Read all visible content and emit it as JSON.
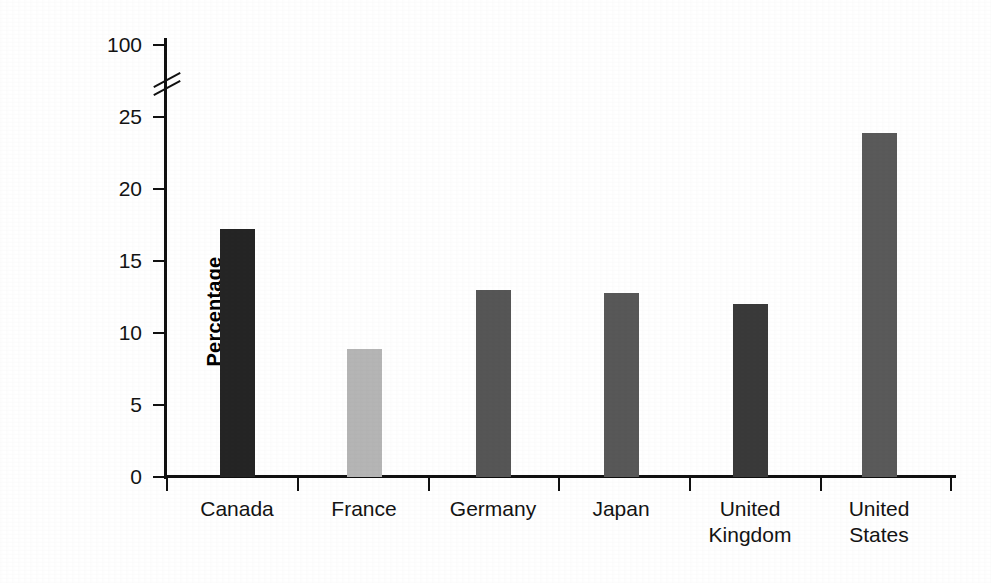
{
  "chart_data": {
    "type": "bar",
    "title": "",
    "xlabel": "",
    "ylabel": "Percentage",
    "categories": [
      "Canada",
      "France",
      "Germany",
      "Japan",
      "United Kingdom",
      "United States"
    ],
    "values": [
      17.2,
      8.9,
      13.0,
      12.8,
      12.0,
      23.9
    ],
    "series": [
      {
        "name": "Percentage",
        "values": [
          17.2,
          8.9,
          13.0,
          12.8,
          12.0,
          23.9
        ]
      }
    ],
    "bar_colors": [
      "#252525",
      "#b5b5b5",
      "#565656",
      "#585858",
      "#3a3a3a",
      "#5a5a5a"
    ],
    "ylim": [
      0,
      25
    ],
    "ytick_labels": [
      "0",
      "5",
      "10",
      "15",
      "20",
      "25",
      "100"
    ],
    "ytick_values": [
      0,
      5,
      10,
      15,
      20,
      25,
      100
    ],
    "axis_break": true,
    "axis_break_note": "broken y-axis between 25 and 100",
    "grid": false,
    "legend": "none",
    "axis_color": "#111111",
    "background_color": "#ffffff"
  },
  "category_labels": [
    "Canada",
    "France",
    "Germany",
    "Japan",
    "United\nKingdom",
    "United\nStates"
  ]
}
